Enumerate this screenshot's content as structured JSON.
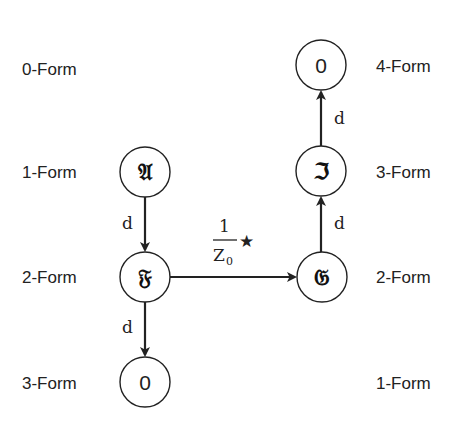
{
  "diagram": {
    "left_column_labels": [
      "0-Form",
      "1-Form",
      "2-Form",
      "3-Form"
    ],
    "right_column_labels": [
      "4-Form",
      "3-Form",
      "2-Form",
      "1-Form"
    ],
    "nodes": {
      "A": {
        "symbol": "𝔄",
        "name": "A (fraktur)",
        "form_level": "1-Form"
      },
      "F": {
        "symbol": "𝔉",
        "name": "F (fraktur)",
        "form_level": "2-Form"
      },
      "zero_bottom": {
        "symbol": "0",
        "form_level": "3-Form"
      },
      "G": {
        "symbol": "𝔊",
        "name": "G (fraktur)",
        "form_level": "2-Form"
      },
      "I": {
        "symbol": "ℑ",
        "name": "I (fraktur)",
        "form_level": "3-Form"
      },
      "zero_top": {
        "symbol": "0",
        "form_level": "4-Form"
      }
    },
    "edges": [
      {
        "from": "A",
        "to": "F",
        "label": "d"
      },
      {
        "from": "F",
        "to": "zero_bottom",
        "label": "d"
      },
      {
        "from": "F",
        "to": "G",
        "label_numerator": "1",
        "label_denominator": "Z",
        "label_subscript": "0",
        "label_operator": "★"
      },
      {
        "from": "G",
        "to": "I",
        "label": "d"
      },
      {
        "from": "I",
        "to": "zero_top",
        "label": "d"
      }
    ],
    "colors": {
      "stroke": "#222222",
      "background": "#ffffff"
    }
  }
}
